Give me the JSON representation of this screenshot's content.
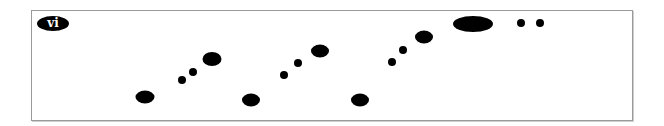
{
  "panel": {
    "label": "vi",
    "colors": {
      "ink": "#000000",
      "background": "#ffffff",
      "border": "#9a9a9a"
    }
  },
  "shapes": [
    {
      "kind": "ellipse",
      "cx": 145,
      "cy": 97,
      "w": 19,
      "h": 13
    },
    {
      "kind": "dot",
      "cx": 182,
      "cy": 80,
      "w": 8,
      "h": 8
    },
    {
      "kind": "dot",
      "cx": 193,
      "cy": 72,
      "w": 8,
      "h": 8
    },
    {
      "kind": "ellipse",
      "cx": 212,
      "cy": 59,
      "w": 19,
      "h": 14
    },
    {
      "kind": "ellipse",
      "cx": 251,
      "cy": 100,
      "w": 18,
      "h": 13
    },
    {
      "kind": "dot",
      "cx": 284,
      "cy": 75,
      "w": 8,
      "h": 8
    },
    {
      "kind": "dot",
      "cx": 298,
      "cy": 63,
      "w": 8,
      "h": 8
    },
    {
      "kind": "ellipse",
      "cx": 320,
      "cy": 51,
      "w": 18,
      "h": 13
    },
    {
      "kind": "ellipse",
      "cx": 360,
      "cy": 100,
      "w": 18,
      "h": 13
    },
    {
      "kind": "dot",
      "cx": 392,
      "cy": 62,
      "w": 8,
      "h": 8
    },
    {
      "kind": "dot",
      "cx": 403,
      "cy": 50,
      "w": 8,
      "h": 8
    },
    {
      "kind": "ellipse",
      "cx": 424,
      "cy": 37,
      "w": 18,
      "h": 13
    },
    {
      "kind": "large-ellipse",
      "cx": 473,
      "cy": 24,
      "w": 40,
      "h": 16
    },
    {
      "kind": "dot",
      "cx": 521,
      "cy": 23,
      "w": 8,
      "h": 8
    },
    {
      "kind": "dot",
      "cx": 540,
      "cy": 23,
      "w": 8,
      "h": 8
    }
  ]
}
